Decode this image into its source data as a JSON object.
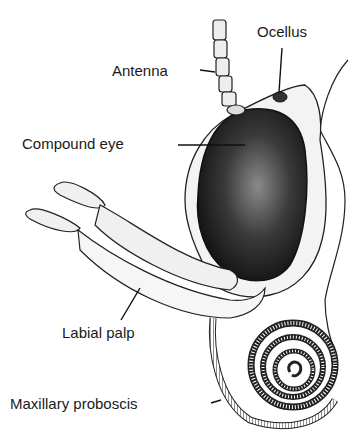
{
  "diagram": {
    "labels": {
      "ocellus": "Ocellus",
      "antenna": "Antenna",
      "compound_eye": "Compound eye",
      "labial_palp": "Labial palp",
      "maxillary_proboscis": "Maxillary proboscis"
    }
  }
}
